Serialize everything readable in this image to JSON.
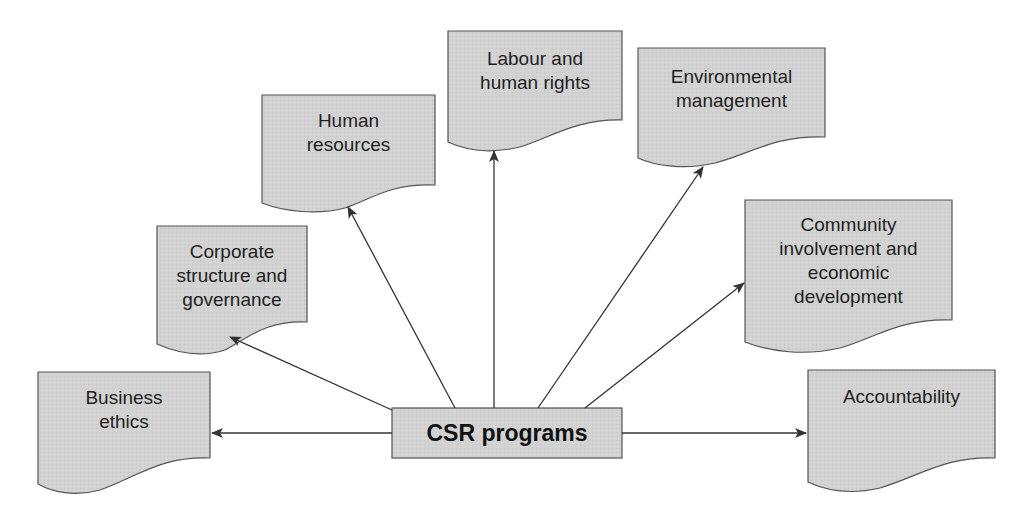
{
  "diagram": {
    "center": {
      "label": "CSR programs"
    },
    "nodes": [
      {
        "id": "business-ethics",
        "label": "Business\nethics"
      },
      {
        "id": "corporate-structure",
        "label": "Corporate\nstructure and\ngovernance"
      },
      {
        "id": "human-resources",
        "label": "Human\nresources"
      },
      {
        "id": "labour-human-rights",
        "label": "Labour and\nhuman rights"
      },
      {
        "id": "environmental-management",
        "label": "Environmental\nmanagement"
      },
      {
        "id": "community-involvement",
        "label": "Community\ninvolvement and\neconomic\ndevelopment"
      },
      {
        "id": "accountability",
        "label": "Accountability"
      }
    ],
    "colors": {
      "box_fill": "#d2d2d2",
      "box_stroke": "#555555",
      "arrow": "#333333",
      "text": "#1e1e1e"
    }
  }
}
